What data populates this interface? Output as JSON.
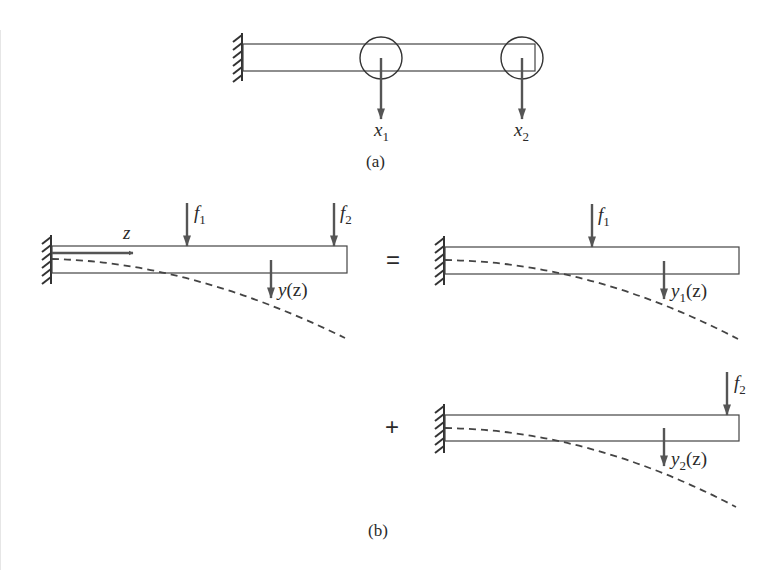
{
  "colors": {
    "stroke": "#333333",
    "arrow": "#555555",
    "background": "#ffffff"
  },
  "panel_a": {
    "caption": "(a)",
    "nodes": [
      {
        "label_var": "x",
        "label_sub": "1"
      },
      {
        "label_var": "x",
        "label_sub": "2"
      }
    ]
  },
  "panel_b": {
    "caption": "(b)",
    "equals_sign": "=",
    "plus_sign": "+",
    "main_beam": {
      "axis_label": "z",
      "force1_var": "f",
      "force1_sub": "1",
      "force2_var": "f",
      "force2_sub": "2",
      "deflection_var": "y",
      "deflection_sub": "",
      "deflection_arg": "(z)"
    },
    "component_1": {
      "force_var": "f",
      "force_sub": "1",
      "deflection_var": "y",
      "deflection_sub": "1",
      "deflection_arg": "(z)"
    },
    "component_2": {
      "force_var": "f",
      "force_sub": "2",
      "deflection_var": "y",
      "deflection_sub": "2",
      "deflection_arg": "(z)"
    }
  }
}
